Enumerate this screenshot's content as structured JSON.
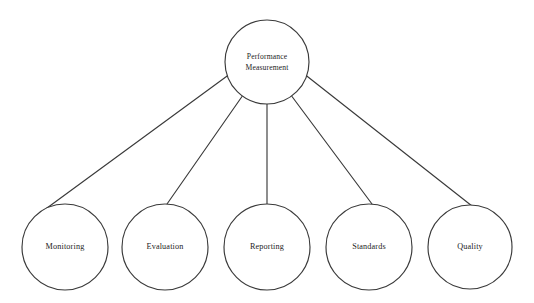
{
  "diagram": {
    "type": "hierarchy-tree",
    "background_color": "#ffffff",
    "stroke_color": "#3a3a3a",
    "text_color": "#1c1c1c",
    "root": {
      "id": "performance-measurement",
      "label_line1": "Performance",
      "label_line2": "Measurement",
      "cx": 267,
      "cy": 62,
      "r": 42
    },
    "children": [
      {
        "id": "monitoring",
        "label": "Monitoring",
        "cx": 65,
        "cy": 247,
        "r": 43
      },
      {
        "id": "evaluation",
        "label": "Evaluation",
        "cx": 165,
        "cy": 247,
        "r": 43
      },
      {
        "id": "reporting",
        "label": "Reporting",
        "cx": 267,
        "cy": 247,
        "r": 43
      },
      {
        "id": "standards",
        "label": "Standards",
        "cx": 369,
        "cy": 247,
        "r": 43
      },
      {
        "id": "quality",
        "label": "Quality",
        "cx": 470,
        "cy": 247,
        "r": 42
      }
    ],
    "edges": [
      {
        "id": "edge-root-monitoring",
        "from": "performance-measurement",
        "to": "monitoring",
        "x1": 228.5,
        "y1": 75.0,
        "x2": 47.0,
        "y2": 208.0
      },
      {
        "id": "edge-root-evaluation",
        "from": "performance-measurement",
        "to": "evaluation",
        "x1": 242.0,
        "y1": 96.5,
        "x2": 167.0,
        "y2": 204.0
      },
      {
        "id": "edge-root-reporting",
        "from": "performance-measurement",
        "to": "reporting",
        "x1": 267.0,
        "y1": 104.0,
        "x2": 267.0,
        "y2": 204.0
      },
      {
        "id": "edge-root-standards",
        "from": "performance-measurement",
        "to": "standards",
        "x1": 292.0,
        "y1": 96.5,
        "x2": 372.0,
        "y2": 204.0
      },
      {
        "id": "edge-root-quality",
        "from": "performance-measurement",
        "to": "quality",
        "x1": 305.5,
        "y1": 75.0,
        "x2": 472.0,
        "y2": 206.0
      }
    ]
  }
}
